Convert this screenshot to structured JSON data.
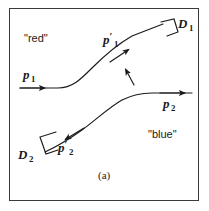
{
  "figure": {
    "caption": "(a)",
    "regions": {
      "upper_label": "\"red\"",
      "lower_label": "\"blue\""
    },
    "detectors": [
      {
        "id": "D1",
        "letter": "D",
        "subscript": "1"
      },
      {
        "id": "D2",
        "letter": "D",
        "subscript": "2"
      }
    ],
    "momenta": [
      {
        "id": "p1",
        "letter": "p",
        "subscript": "1",
        "prime": ""
      },
      {
        "id": "p2",
        "letter": "p",
        "subscript": "2",
        "prime": ""
      },
      {
        "id": "p1prime",
        "letter": "p",
        "subscript": "1",
        "prime": "′"
      },
      {
        "id": "p2prime",
        "letter": "p",
        "subscript": "2",
        "prime": "′"
      }
    ],
    "colors": {
      "ink": "#1a1a1a",
      "frame": "#3a3a3a",
      "background": "#ffffff"
    }
  }
}
